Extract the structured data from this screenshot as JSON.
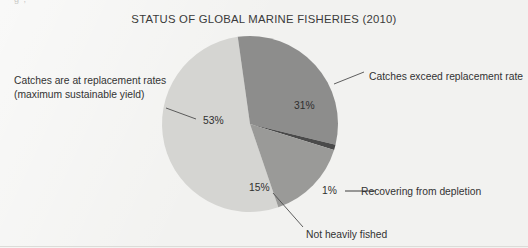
{
  "page": {
    "background_color": "#f2f2f0",
    "crop_artifact_text": "g  ,"
  },
  "chart_title": "STATUS OF GLOBAL MARINE FISHERIES (2010)",
  "labels": {
    "left_line1": "Catches are at replacement rates",
    "left_line2": "(maximum sustainable yield)",
    "right": "Catches exceed replacement rate",
    "recovering": "Recovering from depletion",
    "bottom": "Not heavily fished"
  },
  "value_labels": {
    "replacement": "53%",
    "exceed": "31%",
    "not_heavily_fished": "15%",
    "recovering": "1%"
  },
  "chart_data": {
    "type": "pie",
    "title": "STATUS OF GLOBAL MARINE FISHERIES (2010)",
    "xlabel": "",
    "ylabel": "",
    "legend_position": "callout-labels",
    "grid": false,
    "unit": "percent",
    "total": 100,
    "start_angle_deg": -8,
    "direction": "clockwise",
    "center_px": [
      250,
      124
    ],
    "radius_px": 88,
    "slices": [
      {
        "label": "Catches exceed replacement rate",
        "value": 31,
        "display": "31%",
        "color": "#8d8d8c"
      },
      {
        "label": "Recovering from depletion",
        "value": 1,
        "display": "1%",
        "color": "#4a4a4a"
      },
      {
        "label": "Not heavily fished",
        "value": 15,
        "display": "15%",
        "color": "#9a9a98"
      },
      {
        "label": "Catches are at replacement rates (maximum sustainable yield)",
        "value": 53,
        "display": "53%",
        "color": "#d5d5d2"
      }
    ],
    "categories": [
      "Catches exceed replacement rate",
      "Recovering from depletion",
      "Not heavily fished",
      "Catches are at replacement rates (maximum sustainable yield)"
    ],
    "values": [
      31,
      1,
      15,
      53
    ]
  },
  "colors": {
    "background": "#f2f2f0",
    "text": "#333333",
    "leader_line": "#4d4d4d",
    "slice_exceed": "#8d8d8c",
    "slice_recovering": "#4a4a4a",
    "slice_not_heavily": "#9a9a98",
    "slice_replacement": "#d5d5d2"
  }
}
